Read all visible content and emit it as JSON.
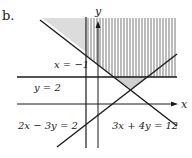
{
  "figure": {
    "part_label": "b.",
    "axis_labels": {
      "x": "x",
      "y": "y"
    },
    "line_labels": {
      "vertical": "x = −1",
      "horizontal": "y = 2",
      "line1": "2x − 3y = 2",
      "line2": "3x + 4y = 12"
    },
    "colors": {
      "line": "#1a1a1a",
      "shade": "#d9d9d9",
      "hatch": "#555555"
    }
  }
}
